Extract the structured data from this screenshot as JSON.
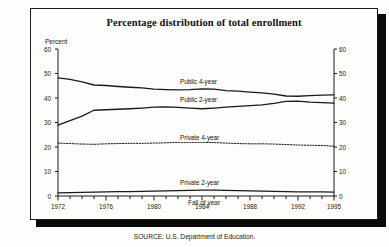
{
  "figure": {
    "title": "Percentage distribution of total enrollment",
    "y_unit_label": "Percent",
    "x_axis_title": "Fall of year",
    "source_note": "SOURCE: U.S. Department of Education."
  },
  "chart_data": {
    "type": "line",
    "title": "Percentage distribution of total enrollment",
    "xlabel": "Fall of year",
    "ylabel": "Percent",
    "xlim": [
      1972,
      1995
    ],
    "ylim": [
      0,
      60
    ],
    "grid": false,
    "legend_position": "inline-labels",
    "y_ticks": [
      0,
      10,
      20,
      30,
      40,
      50,
      60
    ],
    "y_ticks_right": [
      0,
      10,
      20,
      30,
      40,
      50,
      60
    ],
    "x_ticks": [
      1972,
      1976,
      1980,
      1984,
      1988,
      1992,
      1995
    ],
    "x_minor_ticks": [
      1973,
      1974,
      1975,
      1977,
      1978,
      1979,
      1981,
      1982,
      1983,
      1985,
      1986,
      1987,
      1989,
      1990,
      1991,
      1993,
      1994
    ],
    "x": [
      1972,
      1973,
      1974,
      1975,
      1976,
      1977,
      1978,
      1979,
      1980,
      1981,
      1982,
      1983,
      1984,
      1985,
      1986,
      1987,
      1988,
      1989,
      1990,
      1991,
      1992,
      1993,
      1994,
      1995
    ],
    "series": [
      {
        "name": "Public 4-year",
        "style": "solid",
        "color": "#1a1a1a",
        "label_x": 1984,
        "label_y": 46.5,
        "values": [
          48.2,
          47.6,
          46.6,
          45.3,
          45.1,
          44.7,
          44.4,
          44.1,
          43.6,
          43.4,
          43.3,
          43.4,
          43.7,
          43.6,
          43.0,
          42.8,
          42.4,
          42.1,
          41.6,
          40.8,
          40.7,
          41.0,
          41.2,
          41.3
        ]
      },
      {
        "name": "Public 2-year",
        "style": "solid",
        "color": "#1a1a1a",
        "label_x": 1984,
        "label_y": 39.0,
        "values": [
          28.9,
          30.8,
          32.6,
          35.0,
          35.2,
          35.4,
          35.6,
          35.9,
          36.3,
          36.4,
          36.2,
          35.9,
          35.6,
          35.9,
          36.3,
          36.6,
          36.9,
          37.2,
          37.8,
          38.6,
          38.7,
          38.3,
          38.1,
          37.9
        ]
      },
      {
        "name": "Private 4-year",
        "style": "dotted",
        "color": "#1a1a1a",
        "label_x": 1984,
        "label_y": 23.6,
        "values": [
          21.6,
          21.4,
          21.2,
          21.1,
          21.3,
          21.4,
          21.5,
          21.5,
          21.6,
          21.7,
          21.9,
          21.9,
          21.9,
          21.8,
          21.6,
          21.4,
          21.3,
          21.3,
          21.2,
          21.0,
          20.8,
          20.7,
          20.6,
          20.3
        ]
      },
      {
        "name": "Private 2-year",
        "style": "solid",
        "color": "#1a1a1a",
        "label_x": 1984,
        "label_y": 5.2,
        "values": [
          1.3,
          1.4,
          1.5,
          1.6,
          1.7,
          1.8,
          1.8,
          1.9,
          2.0,
          2.1,
          2.2,
          2.3,
          2.4,
          2.4,
          2.3,
          2.2,
          2.1,
          2.0,
          1.9,
          1.8,
          1.7,
          1.7,
          1.7,
          1.6
        ]
      }
    ]
  }
}
